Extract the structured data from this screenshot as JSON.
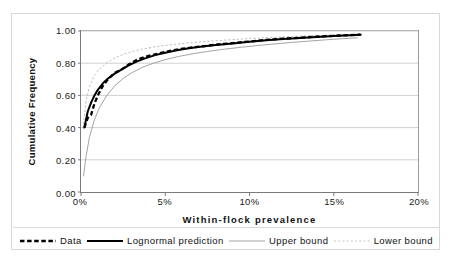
{
  "chart_data": {
    "type": "line",
    "title": "",
    "xlabel": "Within-flock prevalence",
    "ylabel": "Cumulative Frequency",
    "xlim": [
      0,
      20
    ],
    "ylim": [
      0,
      1.0
    ],
    "grid": "horizontal",
    "legend_position": "bottom",
    "x_tick_labels": [
      "0%",
      "5%",
      "10%",
      "15%",
      "20%"
    ],
    "x_tick_values": [
      0,
      5,
      10,
      15,
      20
    ],
    "y_tick_labels": [
      "0.00",
      "0.20",
      "0.40",
      "0.60",
      "0.80",
      "1.00"
    ],
    "y_tick_values": [
      0,
      0.2,
      0.4,
      0.6,
      0.8,
      1.0
    ],
    "series": [
      {
        "name": "Data",
        "style": "thick-dashed-black",
        "color": "#000000",
        "x": [
          0.2,
          0.4,
          0.6,
          0.8,
          1.0,
          1.3,
          1.6,
          2.0,
          2.4,
          2.8,
          3.3,
          3.8,
          4.4,
          5.0,
          5.7,
          6.4,
          7.2,
          8.0,
          9.0,
          10.0,
          11.0,
          12.0,
          13.0,
          14.0,
          15.0,
          16.0,
          16.6
        ],
        "y": [
          0.4,
          0.46,
          0.48,
          0.55,
          0.6,
          0.66,
          0.7,
          0.74,
          0.76,
          0.79,
          0.82,
          0.84,
          0.855,
          0.87,
          0.885,
          0.895,
          0.905,
          0.915,
          0.925,
          0.935,
          0.945,
          0.952,
          0.958,
          0.965,
          0.97,
          0.975,
          0.978
        ]
      },
      {
        "name": "Lognormal prediction",
        "style": "thick-solid-black",
        "color": "#000000",
        "x": [
          0.2,
          0.4,
          0.6,
          0.8,
          1.0,
          1.3,
          1.6,
          2.0,
          2.4,
          2.8,
          3.3,
          3.8,
          4.4,
          5.0,
          5.7,
          6.4,
          7.2,
          8.0,
          9.0,
          10.0,
          11.0,
          12.0,
          13.0,
          14.0,
          15.0,
          16.0,
          16.6
        ],
        "y": [
          0.4,
          0.5,
          0.555,
          0.6,
          0.635,
          0.675,
          0.705,
          0.735,
          0.76,
          0.785,
          0.81,
          0.83,
          0.85,
          0.865,
          0.88,
          0.893,
          0.903,
          0.913,
          0.923,
          0.933,
          0.942,
          0.95,
          0.957,
          0.963,
          0.969,
          0.974,
          0.977
        ]
      },
      {
        "name": "Upper bound",
        "style": "thin-solid-gray",
        "color": "#9a9a9a",
        "x": [
          0.15,
          0.3,
          0.5,
          0.8,
          1.1,
          1.5,
          2.0,
          2.5,
          3.0,
          3.6,
          4.3,
          5.0,
          5.8,
          6.6,
          7.5,
          8.5,
          9.5,
          10.5,
          11.5,
          12.5,
          13.5,
          14.5,
          15.5,
          16.4
        ],
        "y": [
          0.1,
          0.22,
          0.34,
          0.45,
          0.525,
          0.595,
          0.66,
          0.705,
          0.74,
          0.772,
          0.8,
          0.822,
          0.842,
          0.858,
          0.873,
          0.887,
          0.899,
          0.91,
          0.92,
          0.929,
          0.937,
          0.945,
          0.952,
          0.958
        ]
      },
      {
        "name": "Lower bound",
        "style": "thin-dotted-gray",
        "color": "#b5b5b5",
        "x": [
          0.15,
          0.3,
          0.5,
          0.8,
          1.1,
          1.5,
          2.0,
          2.5,
          3.0,
          3.6,
          4.3,
          5.0,
          5.8,
          6.6,
          7.5,
          8.5,
          9.5,
          10.5,
          11.5,
          12.5,
          13.5,
          14.5,
          15.5,
          16.4
        ],
        "y": [
          0.42,
          0.565,
          0.655,
          0.725,
          0.765,
          0.8,
          0.833,
          0.855,
          0.872,
          0.887,
          0.9,
          0.91,
          0.92,
          0.928,
          0.936,
          0.943,
          0.95,
          0.956,
          0.961,
          0.966,
          0.97,
          0.974,
          0.977,
          0.98
        ]
      }
    ]
  },
  "axes": {
    "y_title": "Cumulative Frequency",
    "x_title": "Within-flock prevalence"
  },
  "legend": {
    "items": [
      {
        "label": "Data",
        "style": "thick-dashed-black"
      },
      {
        "label": "Lognormal prediction",
        "style": "thick-solid-black"
      },
      {
        "label": "Upper bound",
        "style": "thin-solid-gray"
      },
      {
        "label": "Lower bound",
        "style": "thin-dotted-gray"
      }
    ]
  }
}
